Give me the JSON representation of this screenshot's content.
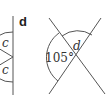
{
  "figure": {
    "part_label": "d",
    "left_partial": {
      "angle_labels": [
        "c",
        "c"
      ]
    },
    "right": {
      "angle_label_variable": "d",
      "angle_label_given": "105°"
    }
  },
  "colors": {
    "line": "#555555",
    "text": "#333333"
  }
}
